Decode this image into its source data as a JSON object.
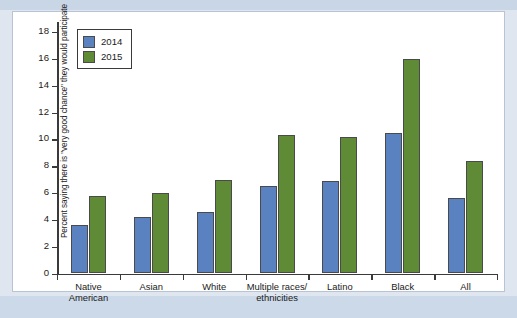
{
  "chart_data": {
    "type": "bar",
    "title": "",
    "subtitle": "",
    "xlabel": "",
    "ylabel": "Percent saying there is \"very good chance\" they would participate",
    "categories": [
      "Native American",
      "Asian",
      "White",
      "Multiple races/ethnicities",
      "Latino",
      "Black",
      "All"
    ],
    "category_lines": [
      [
        "Native",
        "American"
      ],
      [
        "Asian"
      ],
      [
        "White"
      ],
      [
        "Multiple races/",
        "ethnicities"
      ],
      [
        "Latino"
      ],
      [
        "Black"
      ],
      [
        "All"
      ]
    ],
    "series": [
      {
        "name": "2014",
        "color": "#5b82c0",
        "values": [
          3.6,
          4.2,
          4.6,
          6.5,
          6.9,
          10.5,
          5.6
        ]
      },
      {
        "name": "2015",
        "color": "#5f8a36",
        "values": [
          5.8,
          6.0,
          7.0,
          10.3,
          10.2,
          16.0,
          8.4
        ]
      }
    ],
    "ylim": [
      0,
      18
    ],
    "ytick_labels": [
      "0",
      "2",
      "4",
      "6",
      "8",
      "10",
      "12",
      "14",
      "16",
      "18"
    ],
    "ytick_values": [
      0,
      2,
      4,
      6,
      8,
      10,
      12,
      14,
      16,
      18
    ],
    "grid": false,
    "legend_position": "top-left",
    "legend_entries": [
      "2014",
      "2015"
    ]
  }
}
